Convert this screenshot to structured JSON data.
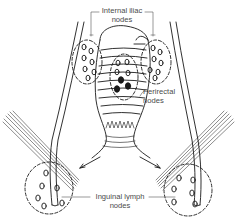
{
  "diagram": {
    "labels": {
      "internal_iliac": {
        "line1": "Internal iliac",
        "line2": "nodes"
      },
      "perirectal": {
        "line1": "Perirectal",
        "line2": "nodes"
      },
      "inguinal": {
        "line1": "Inguinal lymph",
        "line2": "nodes"
      }
    },
    "colors": {
      "ink": "#1a1a1a",
      "label_text": "#4a4a4a",
      "background": "#ffffff"
    }
  }
}
